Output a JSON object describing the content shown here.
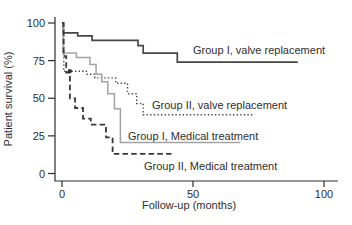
{
  "chart_data": {
    "type": "line",
    "subtype": "kaplan-meier-step",
    "title": "",
    "xlabel": "Follow-up (months)",
    "ylabel": "Patient survival (%)",
    "xlim": [
      0,
      100
    ],
    "ylim": [
      0,
      100
    ],
    "x_ticks": [
      0,
      50,
      100
    ],
    "y_ticks": [
      0,
      25,
      50,
      75,
      100
    ],
    "grid": false,
    "legend_position": "inline-labels",
    "colors": {
      "dark_line": "#464646",
      "gray_line": "#a2a2a2",
      "text": "#2e2e2e",
      "axis": "#2e2e2e",
      "background": "#ffffff"
    },
    "series": [
      {
        "name": "Group I, valve replacement",
        "style": "solid",
        "color": "#464646",
        "width": 1.7,
        "steps": [
          [
            0,
            100
          ],
          [
            0.5,
            93.5
          ],
          [
            6,
            91.5
          ],
          [
            11.5,
            88.5
          ],
          [
            29,
            85
          ],
          [
            31,
            80
          ],
          [
            44,
            74
          ]
        ],
        "end_month": 90,
        "label": {
          "text": "Group I, valve replacement",
          "px": [
            193,
            50
          ]
        }
      },
      {
        "name": "Group II, valve replacement",
        "style": "dotted",
        "color": "#4a4a4a",
        "width": 1.4,
        "steps": [
          [
            0,
            100
          ],
          [
            0.7,
            68
          ],
          [
            9.3,
            66
          ],
          [
            12.5,
            63.5
          ],
          [
            20.5,
            60
          ],
          [
            25,
            53
          ],
          [
            28.5,
            46.5
          ],
          [
            31,
            39
          ]
        ],
        "end_month": 73,
        "label": {
          "text": "Group II, valve replacement",
          "px": [
            152,
            105
          ]
        }
      },
      {
        "name": "Group I, Medical treatment",
        "style": "solid",
        "color": "#a2a2a2",
        "width": 1.5,
        "steps": [
          [
            0,
            100
          ],
          [
            0.4,
            80
          ],
          [
            5.5,
            77
          ],
          [
            10.7,
            72.5
          ],
          [
            13,
            66
          ],
          [
            15.2,
            61
          ],
          [
            17.5,
            53
          ],
          [
            20,
            43
          ],
          [
            22.3,
            20.5
          ]
        ],
        "end_month": 68,
        "label": {
          "text": "Group I, Medical treatment",
          "px": [
            128,
            136
          ]
        }
      },
      {
        "name": "Group II, Medical treatment",
        "style": "dashed",
        "color": "#383838",
        "width": 1.8,
        "steps": [
          [
            0,
            100
          ],
          [
            0.6,
            78
          ],
          [
            1.6,
            67
          ],
          [
            3,
            50
          ],
          [
            5,
            43.5
          ],
          [
            8,
            36.5
          ],
          [
            11,
            32.5
          ],
          [
            16.8,
            24
          ],
          [
            19.3,
            13
          ]
        ],
        "end_month": 43,
        "label": {
          "text": "Group II, Medical treatment",
          "px": [
            144,
            166
          ]
        }
      }
    ],
    "markers": [
      {
        "series": "Group II, valve replacement",
        "x_month": 3,
        "y_pct": 68,
        "shape": "dot"
      }
    ]
  }
}
